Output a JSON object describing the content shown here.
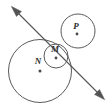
{
  "figure": {
    "background_color": "#ffffff",
    "stroke_color": "#5a5a5a",
    "line_color": "#555555",
    "label_color": "#2b2b2b",
    "width": 112,
    "height": 110,
    "circles": [
      {
        "id": "circle-n",
        "label": "N",
        "cx": 40,
        "cy": 71,
        "r": 31.5,
        "label_x": 38,
        "label_y": 64,
        "dot_x": 40,
        "dot_y": 71,
        "dot_r": 1.5
      },
      {
        "id": "circle-m",
        "label": "M",
        "cx": 56,
        "cy": 56,
        "r": 12,
        "label_x": 55,
        "label_y": 52,
        "dot_x": 56,
        "dot_y": 58,
        "dot_r": 1.4
      },
      {
        "id": "circle-p",
        "label": "P",
        "cx": 78,
        "cy": 31,
        "r": 17,
        "label_x": 76,
        "label_y": 29,
        "dot_x": 77,
        "dot_y": 34,
        "dot_r": 1.4
      }
    ],
    "line": {
      "id": "secant-line",
      "x1": 13,
      "y1": 8,
      "x2": 103,
      "y2": 98,
      "arrow_start": "upper-left",
      "arrow_end": "lower-right",
      "double_headed": true
    },
    "labels": [
      "M",
      "N",
      "P"
    ]
  }
}
